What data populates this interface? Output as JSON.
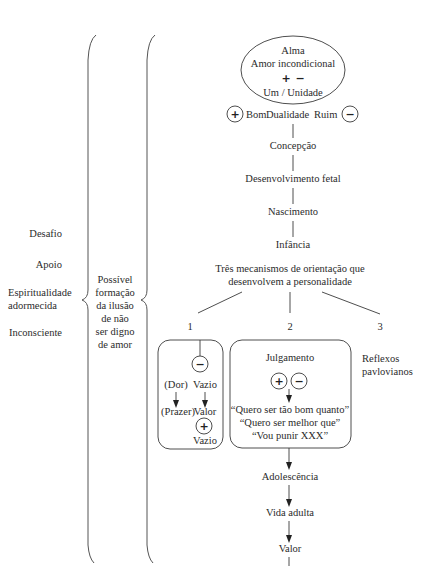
{
  "left_labels": {
    "desafio": "Desafio",
    "apoio": "Apoio",
    "espiritualidade_line1": "Espiritualidade",
    "espiritualidade_line2": "adormecida",
    "inconsciente": "Inconsciente"
  },
  "middle_note": [
    "Possível",
    "formação",
    "da ilusão",
    "de não",
    "ser digno",
    "de amor"
  ],
  "soul": {
    "line1": "Alma",
    "line2": "Amor incondicional",
    "plus": "+",
    "minus": "−",
    "line4": "Um / Unidade"
  },
  "duality": {
    "plus_icon": "+",
    "good": "Bom",
    "label": "Dualidade",
    "bad": "Ruim",
    "minus_icon": "−"
  },
  "stages": {
    "concepcao": "Concepção",
    "fetal": "Desenvolvimento fetal",
    "nascimento": "Nascimento",
    "infancia": "Infância"
  },
  "mechanisms": {
    "title_line1": "Três mecanismos de orientação que",
    "title_line2": "desenvolvem a personalidade",
    "n1": "1",
    "n2": "2",
    "n3": "3"
  },
  "box1": {
    "minus": "−",
    "dor": "(Dor)",
    "prazer": "(Prazer)",
    "vazio_top": "Vazio",
    "valor": "Valor",
    "plus": "+",
    "vazio_bottom": "Vazio"
  },
  "box2": {
    "title": "Julgamento",
    "plus": "+",
    "minus": "−",
    "quote1": "“Quero ser tão bom quanto”",
    "quote2": "“Quero ser melhor que”",
    "quote3": "“Vou punir XXX”"
  },
  "reflexes": {
    "line1": "Reflexos",
    "line2": "pavlovianos"
  },
  "later_stages": {
    "adolescencia": "Adolescência",
    "adulta": "Vida adulta",
    "valor": "Valor"
  }
}
